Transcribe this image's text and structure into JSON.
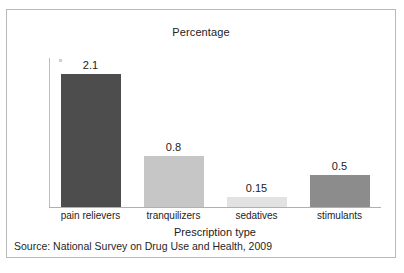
{
  "figure": {
    "source_note": "Source: National Survey on Drug Use and Health, 2009"
  },
  "chart_data": {
    "type": "bar",
    "title": "Percentage",
    "xlabel": "Prescription type",
    "ylabel": "",
    "categories": [
      "pain relievers",
      "tranquilizers",
      "sedatives",
      "stimulants"
    ],
    "values": [
      2.1,
      0.8,
      0.15,
      0.5
    ],
    "value_labels": [
      "2.1",
      "0.8",
      "0.15",
      "0.5"
    ],
    "bar_colors": [
      "#4d4d4d",
      "#c6c6c6",
      "#e2e2e2",
      "#8c8c8c"
    ],
    "ylim": [
      0,
      2.35
    ],
    "grid": false,
    "legend": "none",
    "axis_color": "#b4b4b4"
  }
}
